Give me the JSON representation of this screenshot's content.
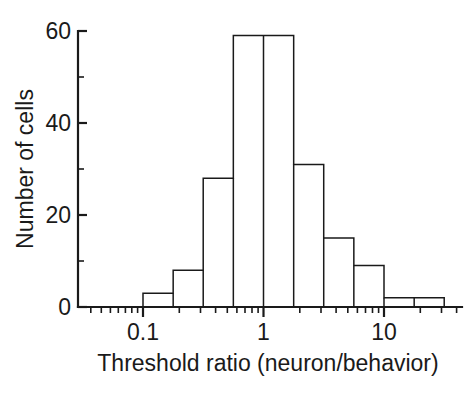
{
  "figure": {
    "name": "threshold-ratio-histogram",
    "background_color": "#ffffff",
    "line_color": "#1a1a1a"
  },
  "chart_data": {
    "type": "bar",
    "title": "",
    "subtitle": "",
    "xlabel": "Threshold ratio (neuron/behavior)",
    "ylabel": "Number of cells",
    "xscale": "log",
    "yscale": "linear",
    "xlim": [
      0.0422,
      31.6
    ],
    "ylim": [
      0,
      62
    ],
    "grid": false,
    "legend": null,
    "bin_edges": [
      0.1,
      0.178,
      0.316,
      0.562,
      1.0,
      1.78,
      3.16,
      5.62,
      10.0,
      17.8,
      31.6
    ],
    "categories": [
      "0.10-0.18",
      "0.18-0.32",
      "0.32-0.56",
      "0.56-1.0",
      "1.0-1.78",
      "1.78-3.16",
      "3.16-5.62",
      "5.62-10",
      "10-17.8",
      "17.8-31.6"
    ],
    "values": [
      3,
      8,
      28,
      59,
      59,
      31,
      15,
      9,
      2,
      2
    ],
    "x_ticks_major": [
      0.1,
      1,
      10
    ],
    "x_tick_labels": [
      "0.1",
      "1",
      "10"
    ],
    "x_ticks_minor": [
      0.05,
      0.06,
      0.07,
      0.08,
      0.09,
      0.2,
      0.3,
      0.4,
      0.5,
      0.6,
      0.7,
      0.8,
      0.9,
      2,
      3,
      4,
      5,
      6,
      7,
      8,
      9,
      20,
      30
    ],
    "y_ticks_major": [
      0,
      20,
      40,
      60
    ],
    "y_tick_labels": [
      "0",
      "20",
      "40",
      "60"
    ],
    "y_ticks_minor": [
      10,
      30,
      50
    ]
  },
  "axis": {
    "x_label": "Threshold ratio (neuron/behavior)",
    "y_label": "Number of cells",
    "x_tick_0": "0.1",
    "x_tick_1": "1",
    "x_tick_2": "10",
    "y_tick_0": "0",
    "y_tick_1": "20",
    "y_tick_2": "40",
    "y_tick_3": "60"
  }
}
